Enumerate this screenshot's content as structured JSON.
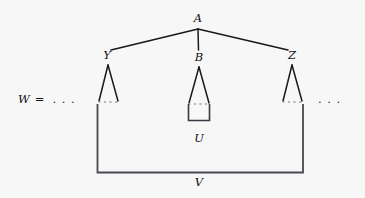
{
  "figure": {
    "kind": "syntax-tree-diagram",
    "background_color": "#f8f7f8",
    "ink_color": "#1a181e",
    "equation_lhs": "W",
    "equation_equals": "=",
    "equation_left_ellipsis": ". . .",
    "right_ellipsis": ". . .",
    "nodes": {
      "root": "A",
      "left": "Y",
      "middle": "B",
      "right": "Z",
      "inner_bracket": "U",
      "outer_bracket": "V"
    },
    "labels": [
      {
        "id": "A",
        "text": "A",
        "x": 198,
        "y": 19
      },
      {
        "id": "Y",
        "text": "Y",
        "x": 107,
        "y": 56
      },
      {
        "id": "B",
        "text": "B",
        "x": 199,
        "y": 58
      },
      {
        "id": "Z",
        "text": "Z",
        "x": 292,
        "y": 56
      },
      {
        "id": "U",
        "text": "U",
        "x": 199,
        "y": 139
      },
      {
        "id": "V",
        "text": "V",
        "x": 199,
        "y": 183
      }
    ],
    "edges": [
      {
        "from": "A",
        "to": "Y",
        "x1": 198,
        "y1": 29,
        "x2": 111,
        "y2": 50
      },
      {
        "from": "A",
        "to": "B",
        "x1": 198,
        "y1": 29,
        "x2": 198,
        "y2": 50
      },
      {
        "from": "A",
        "to": "Z",
        "x1": 198,
        "y1": 29,
        "x2": 288,
        "y2": 50
      }
    ],
    "triangles": [
      {
        "under": "Y",
        "apex_x": 108,
        "apex_y": 65,
        "left_x": 99,
        "right_x": 118,
        "base_y": 101
      },
      {
        "under": "B",
        "apex_x": 199,
        "apex_y": 67,
        "left_x": 189,
        "right_x": 209,
        "base_y": 103
      },
      {
        "under": "Z",
        "apex_x": 292,
        "apex_y": 65,
        "left_x": 283,
        "right_x": 302,
        "base_y": 101
      }
    ],
    "brackets": [
      {
        "id": "U",
        "left_x": 188,
        "right_x": 210,
        "top_y": 104,
        "bottom_y": 121
      },
      {
        "id": "V",
        "left_x": 97,
        "right_x": 303,
        "top_y": 104,
        "bottom_y": 173
      }
    ]
  }
}
